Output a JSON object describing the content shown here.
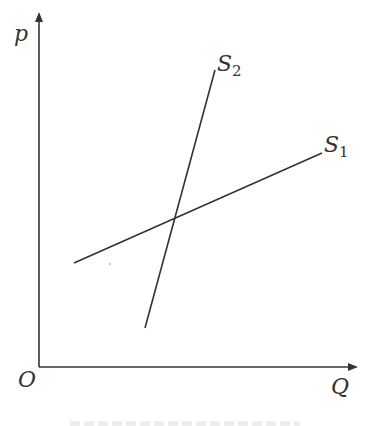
{
  "figure": {
    "axes": {
      "y_label": "p",
      "x_label": "Q",
      "origin_label": "O"
    },
    "curves": [
      {
        "name": "S1",
        "label_main": "S",
        "label_sub": "1",
        "x1": 74,
        "y1": 263,
        "x2": 322,
        "y2": 153
      },
      {
        "name": "S2",
        "label_main": "S",
        "label_sub": "2",
        "x1": 145,
        "y1": 328,
        "x2": 215,
        "y2": 70
      }
    ],
    "colors": {
      "line": "#333333",
      "background": "#ffffff"
    }
  }
}
